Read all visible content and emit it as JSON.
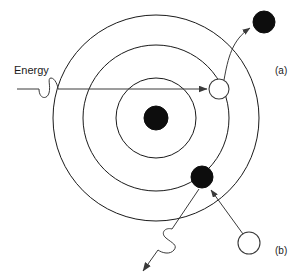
{
  "figure": {
    "background_color": "#ffffff",
    "line_color": "#1a1a1a",
    "ray_color": "#3a3a3a",
    "filled_electron_color": "#0d0d0d",
    "hollow_electron_fill": "#ffffff",
    "width": 302,
    "height": 277
  },
  "labels": {
    "energy": "Energy",
    "panel_a": "(a)",
    "panel_b": "(b)"
  },
  "nucleus": {
    "name": "nucleus",
    "cx": 156,
    "cy": 118,
    "r": 12,
    "fill": "#0d0d0d"
  },
  "orbits": [
    {
      "name": "inner-orbit",
      "cx": 156,
      "cy": 118,
      "r": 40
    },
    {
      "name": "middle-orbit",
      "cx": 156,
      "cy": 118,
      "r": 73
    },
    {
      "name": "outer-orbit",
      "cx": 156,
      "cy": 118,
      "r": 103
    }
  ],
  "electrons": [
    {
      "name": "electron-absorbing-hollow",
      "cx": 219,
      "cy": 89,
      "r": 10,
      "style": "hollow",
      "panel": "a"
    },
    {
      "name": "electron-excited-filled",
      "cx": 264,
      "cy": 22,
      "r": 11,
      "style": "filled",
      "panel": "a"
    },
    {
      "name": "electron-relaxed-filled",
      "cx": 202,
      "cy": 177,
      "r": 11,
      "style": "filled",
      "panel": "b"
    },
    {
      "name": "electron-origin-hollow",
      "cx": 249,
      "cy": 243,
      "r": 11,
      "style": "hollow",
      "panel": "b"
    }
  ],
  "rays": {
    "incoming_photon": {
      "name": "incoming-photon-arrow",
      "description": "horizontal arrow with photon squiggle entering from the left",
      "x1": 17,
      "y1": 89,
      "x2": 207,
      "y2": 89,
      "squiggle_center_x": 48,
      "squiggle_center_y": 89
    },
    "excitation_path": {
      "name": "excitation-path-arrow",
      "description": "curved arrow from absorbing electron outward to excited electron",
      "from_x": 222,
      "from_y": 78,
      "to_x": 252,
      "to_y": 27
    },
    "emission_path": {
      "name": "emission-path-arrow",
      "description": "arrow from outer hollow electron inward to relaxed electron",
      "from_x": 243,
      "from_y": 233,
      "to_x": 210,
      "to_y": 189
    },
    "emitted_photon": {
      "name": "emitted-photon-arrow",
      "description": "diagonal arrow with photon squiggle leaving toward lower left",
      "x1": 198,
      "y1": 190,
      "x2": 144,
      "y2": 270,
      "squiggle_center_x": 165,
      "squiggle_center_y": 243
    }
  },
  "panels": [
    {
      "id": "a",
      "label": "(a)",
      "x": 278,
      "y": 70,
      "meaning": "absorption: photon excites electron to higher orbit"
    },
    {
      "id": "b",
      "label": "(b)",
      "x": 278,
      "y": 250,
      "meaning": "emission: electron drops to lower orbit and emits photon"
    }
  ]
}
